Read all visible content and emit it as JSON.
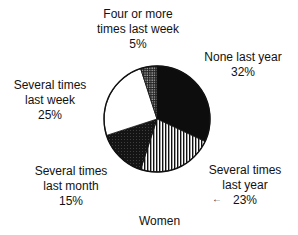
{
  "chart_data": {
    "type": "pie",
    "title": "Women",
    "categories": [
      "None last year",
      "Several times last year",
      "Several times last month",
      "Several times last week",
      "Four or more times last week"
    ],
    "values": [
      32,
      23,
      15,
      25,
      5
    ],
    "units": "%",
    "start_angle_deg": 0,
    "direction": "clockwise",
    "fills": [
      "solid-black",
      "vertical-stripes",
      "dark-stipple",
      "white",
      "grid-dots"
    ],
    "legend": "none",
    "labels": [
      {
        "lines": [
          "None last year",
          "32%"
        ]
      },
      {
        "lines": [
          "Several times",
          "last year",
          "23%"
        ]
      },
      {
        "lines": [
          "Several times",
          "last month",
          "15%"
        ]
      },
      {
        "lines": [
          "Several times",
          "last week",
          "25%"
        ]
      },
      {
        "lines": [
          "Four or more",
          "times last week",
          "5%"
        ]
      }
    ]
  },
  "labels": {
    "none_last_year": {
      "l1": "None last year",
      "pct": "32%"
    },
    "several_last_year": {
      "l1": "Several times",
      "l2": "last year",
      "pct": "23%"
    },
    "several_last_month": {
      "l1": "Several times",
      "l2": "last month",
      "pct": "15%"
    },
    "several_last_week": {
      "l1": "Several times",
      "l2": "last week",
      "pct": "25%"
    },
    "four_or_more": {
      "l1": "Four or more",
      "l2": "times last week",
      "pct": "5%"
    }
  },
  "title": "Women"
}
